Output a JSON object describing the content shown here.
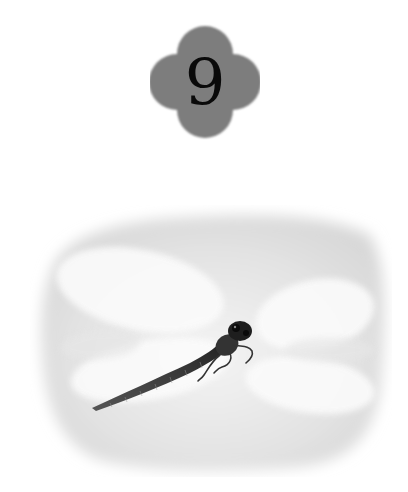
{
  "badge": {
    "number": "9",
    "shape": "quatrefoil",
    "fill_color": "#7a7a7a",
    "text_color": "#0a0a0a"
  },
  "photo": {
    "subject": "dragonfly",
    "background": "soft gray vignette",
    "icon": "dragonfly-icon"
  }
}
